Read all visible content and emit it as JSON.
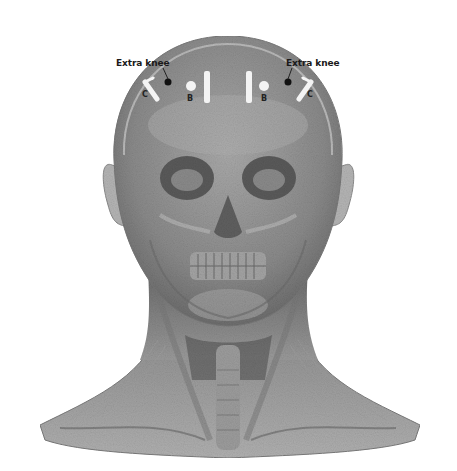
{
  "figure": {
    "background": "#ffffff",
    "tone": "grayscale"
  },
  "annotations": {
    "left": {
      "label": "Extra knee",
      "marker_b": "B",
      "marker_c": "C"
    },
    "right": {
      "label": "Extra knee",
      "marker_b": "B",
      "marker_c": "C"
    }
  },
  "colors": {
    "skin_light": "#b8b8b8",
    "skin_mid": "#8f8f8f",
    "skin_dark": "#5e5e5e",
    "marker_white": "#f4f4f4",
    "dot_black": "#111111"
  }
}
